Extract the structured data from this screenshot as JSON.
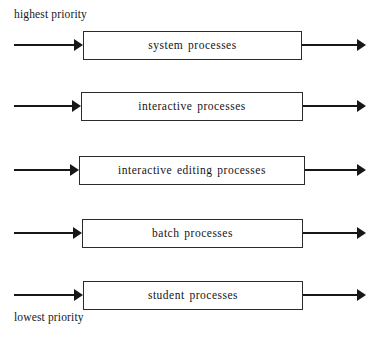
{
  "diagram": {
    "type": "multilevel-queue-scheduling",
    "top_label": "highest priority",
    "bottom_label": "lowest priority",
    "colors": {
      "background": "#ffffff",
      "stroke": "#17171a",
      "box_border": "#2b2b2e",
      "text": "#141417"
    },
    "queues": [
      {
        "label": "system processes",
        "priority_rank": 1,
        "box": {
          "x": 83,
          "y": 31,
          "width": 219,
          "height": 29
        },
        "in_arrow": {
          "x": 14,
          "width": 69
        },
        "out_arrow": {
          "x": 302,
          "width": 64
        }
      },
      {
        "label": "interactive processes",
        "priority_rank": 2,
        "box": {
          "x": 81,
          "y": 92,
          "width": 222,
          "height": 29
        },
        "in_arrow": {
          "x": 14,
          "width": 67
        },
        "out_arrow": {
          "x": 303,
          "width": 63
        }
      },
      {
        "label": "interactive editing processes",
        "priority_rank": 3,
        "box": {
          "x": 79,
          "y": 156,
          "width": 226,
          "height": 29
        },
        "in_arrow": {
          "x": 14,
          "width": 65
        },
        "out_arrow": {
          "x": 305,
          "width": 61
        }
      },
      {
        "label": "batch processes",
        "priority_rank": 4,
        "box": {
          "x": 82,
          "y": 219,
          "width": 221,
          "height": 29
        },
        "in_arrow": {
          "x": 14,
          "width": 68
        },
        "out_arrow": {
          "x": 303,
          "width": 63
        }
      },
      {
        "label": "student processes",
        "priority_rank": 5,
        "box": {
          "x": 83,
          "y": 281,
          "width": 220,
          "height": 29
        },
        "in_arrow": {
          "x": 14,
          "width": 69
        },
        "out_arrow": {
          "x": 303,
          "width": 63
        }
      }
    ]
  }
}
